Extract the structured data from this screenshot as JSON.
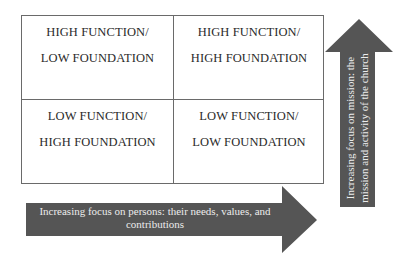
{
  "matrix": {
    "top_left": {
      "line1": "HIGH FUNCTION/",
      "line2": "LOW FOUNDATION"
    },
    "top_right": {
      "line1": "HIGH FUNCTION/",
      "line2": "HIGH FOUNDATION"
    },
    "bottom_left": {
      "line1": "LOW FUNCTION/",
      "line2": "HIGH FOUNDATION"
    },
    "bottom_right": {
      "line1": "LOW FUNCTION/",
      "line2": "LOW FOUNDATION"
    }
  },
  "horizontal_arrow": {
    "line1": "Increasing focus on persons: their needs, values, and",
    "line2": "contributions",
    "color": "#555555"
  },
  "vertical_arrow": {
    "line1": "Increasing focus on mission: the",
    "line2": "mission and activity of the church",
    "color": "#555555"
  }
}
